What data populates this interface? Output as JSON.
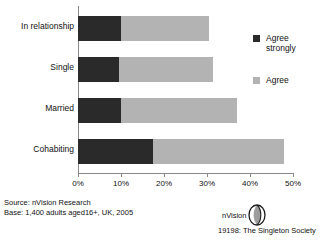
{
  "chart_data": {
    "type": "bar",
    "orientation": "horizontal",
    "stacked": true,
    "title": "",
    "xlabel": "",
    "ylabel": "",
    "categories": [
      "In relationship",
      "Single",
      "Married",
      "Cohabiting"
    ],
    "series": [
      {
        "name": "Agree strongly",
        "color": "#2a2a2a",
        "values": [
          10,
          9.5,
          10,
          17.5
        ]
      },
      {
        "name": "Agree",
        "color": "#b3b3b3",
        "values": [
          20.5,
          22,
          27,
          30.5
        ]
      }
    ],
    "totals": [
      30.5,
      31.5,
      37,
      48
    ],
    "xlim": [
      0,
      50
    ],
    "xticks": [
      0,
      10,
      20,
      30,
      40,
      50
    ],
    "xtick_labels": [
      "0%",
      "10%",
      "20%",
      "30%",
      "40%",
      "50%"
    ],
    "grid": false,
    "legend_position": "right"
  },
  "legend": {
    "items": [
      {
        "label_line1": "Agree",
        "label_line2": "strongly",
        "swatch": "dark-swatch-icon"
      },
      {
        "label_line1": "Agree",
        "label_line2": "",
        "swatch": "light-swatch-icon"
      }
    ]
  },
  "footer": {
    "source": "Source: nVision Research",
    "base": "Base: 1,400 adults aged16+, UK, 2005",
    "credit": "19198: The Singleton Society"
  },
  "brand": {
    "name": "nVision"
  }
}
